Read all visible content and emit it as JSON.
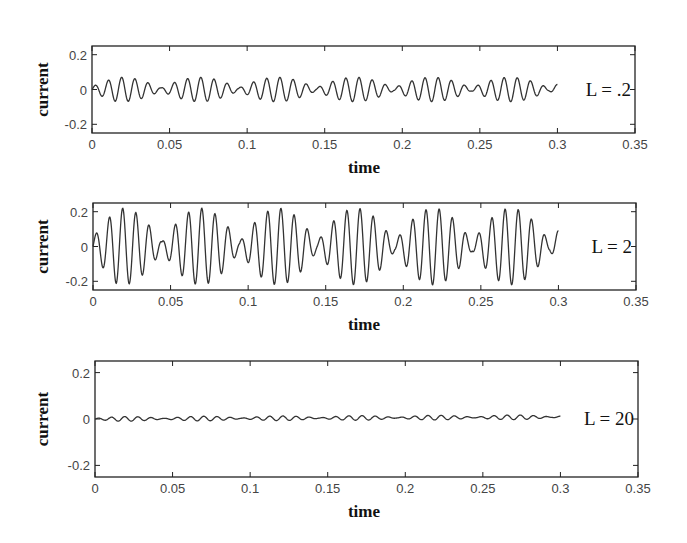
{
  "figure": {
    "panels": [
      {
        "id": "p1",
        "annotation": "L = .2",
        "xlabel": "time",
        "ylabel": "current"
      },
      {
        "id": "p2",
        "annotation": "L = 2",
        "xlabel": "time",
        "ylabel": "current"
      },
      {
        "id": "p3",
        "annotation": "L = 20",
        "xlabel": "time",
        "ylabel": "current"
      }
    ]
  },
  "chart_data": [
    {
      "type": "line",
      "title": "",
      "annotation": "L = .2",
      "xlabel": "time",
      "ylabel": "current",
      "xlim": [
        0,
        0.35
      ],
      "ylim": [
        -0.25,
        0.25
      ],
      "xticks": [
        "0",
        "0.05",
        "0.1",
        "0.15",
        "0.2",
        "0.25",
        "0.3",
        "0.35"
      ],
      "yticks": [
        "0.2",
        "0",
        "-0.2"
      ],
      "grid": false,
      "series": [
        {
          "name": "current",
          "x_range": [
            0,
            0.3
          ],
          "shape": "beat oscillation",
          "amplitude": 0.07,
          "carrier_period": 0.0085,
          "envelope_period": 0.05
        }
      ]
    },
    {
      "type": "line",
      "title": "",
      "annotation": "L = 2",
      "xlabel": "time",
      "ylabel": "current",
      "xlim": [
        0,
        0.35
      ],
      "ylim": [
        -0.25,
        0.25
      ],
      "xticks": [
        "0",
        "0.05",
        "0.1",
        "0.15",
        "0.2",
        "0.25",
        "0.3",
        "0.35"
      ],
      "yticks": [
        "0.2",
        "0",
        "-0.2"
      ],
      "grid": false,
      "series": [
        {
          "name": "current",
          "x_range": [
            0,
            0.3
          ],
          "shape": "beat oscillation",
          "amplitude": 0.22,
          "carrier_period": 0.0085,
          "envelope_period": 0.05
        }
      ]
    },
    {
      "type": "line",
      "title": "",
      "annotation": "L = 20",
      "xlabel": "time",
      "ylabel": "current",
      "xlim": [
        0,
        0.35
      ],
      "ylim": [
        -0.25,
        0.25
      ],
      "xticks": [
        "0",
        "0.05",
        "0.1",
        "0.15",
        "0.2",
        "0.25",
        "0.3",
        "0.35"
      ],
      "yticks": [
        "0.2",
        "0",
        "-0.2"
      ],
      "grid": false,
      "series": [
        {
          "name": "current",
          "x_range": [
            0,
            0.3
          ],
          "shape": "beat oscillation",
          "amplitude": 0.01,
          "offset_drift": 0.008,
          "carrier_period": 0.0085,
          "envelope_period": 0.05
        }
      ]
    }
  ]
}
